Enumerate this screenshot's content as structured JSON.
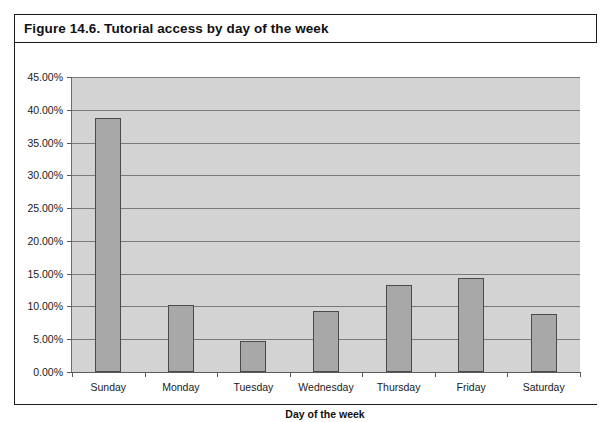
{
  "figure": {
    "caption": "Figure 14.6. Tutorial access by day of the week"
  },
  "chart_data": {
    "type": "bar",
    "title": "Figure 14.6. Tutorial access by day of the week",
    "xlabel": "Day of the week",
    "ylabel": "",
    "categories": [
      "Sunday",
      "Monday",
      "Tuesday",
      "Wednesday",
      "Thursday",
      "Friday",
      "Saturday"
    ],
    "values": [
      38.8,
      10.2,
      4.8,
      9.3,
      13.2,
      14.3,
      8.8
    ],
    "value_labels": [
      "38.80%",
      "10.20%",
      "4.80%",
      "9.30%",
      "13.20%",
      "14.30%",
      "8.80%"
    ],
    "ylim": [
      0,
      45
    ],
    "ytick_values": [
      0,
      5,
      10,
      15,
      20,
      25,
      30,
      35,
      40,
      45
    ],
    "ytick_labels": [
      "0.00%",
      "5.00%",
      "10.00%",
      "15.00%",
      "20.00%",
      "25.00%",
      "30.00%",
      "35.00%",
      "40.00%",
      "45.00%"
    ],
    "grid": true,
    "legend": null,
    "legend_position": "none",
    "series_name": "Tutorial access",
    "colors": {
      "bar_fill": "#a8a8a8",
      "bar_border": "#4a4a4a",
      "plot_background": "#d3d3d3",
      "gridline": "#7a7a7a",
      "axis": "#5a5a5a",
      "text": "#1a1a1a",
      "frame": "#1b1b1b",
      "page_background": "#ffffff"
    }
  }
}
